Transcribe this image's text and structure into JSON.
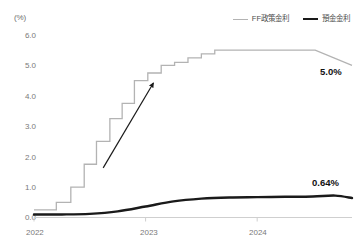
{
  "chart_data": {
    "type": "line",
    "title": "",
    "subtitle": "",
    "xlabel": "",
    "ylabel": "",
    "unit_label": "(%)",
    "ylim": [
      0.0,
      6.0
    ],
    "yticks": [
      "6.0",
      "5.0",
      "4.0",
      "3.0",
      "2.0",
      "1.0",
      "0.0"
    ],
    "ytick_values": [
      6.0,
      5.0,
      4.0,
      3.0,
      2.0,
      1.0,
      0.0
    ],
    "xticks": [
      "2022",
      "2023",
      "2024"
    ],
    "xtick_values": [
      2022.0,
      2023.0,
      2024.0
    ],
    "xlim": [
      2022.0,
      2024.85
    ],
    "grid": false,
    "legend_position": "top-right",
    "series": [
      {
        "name": "FF政策金利",
        "color": "#b3b3b3",
        "style": "step",
        "width": 1.3,
        "end_label": "5.0%",
        "x": [
          2022.0,
          2022.2,
          2022.2,
          2022.33,
          2022.33,
          2022.45,
          2022.45,
          2022.56,
          2022.56,
          2022.68,
          2022.68,
          2022.79,
          2022.79,
          2022.9,
          2022.9,
          2023.02,
          2023.02,
          2023.14,
          2023.14,
          2023.26,
          2023.26,
          2023.38,
          2023.38,
          2023.5,
          2023.5,
          2023.62,
          2023.62,
          2024.52,
          2024.85
        ],
        "values": [
          0.25,
          0.25,
          0.5,
          0.5,
          1.0,
          1.0,
          1.75,
          1.75,
          2.5,
          2.5,
          3.25,
          3.25,
          3.75,
          3.75,
          4.5,
          4.5,
          4.75,
          4.75,
          5.0,
          5.0,
          5.1,
          5.1,
          5.25,
          5.25,
          5.38,
          5.38,
          5.5,
          5.5,
          5.0
        ]
      },
      {
        "name": "預金金利",
        "color": "#1a1a1a",
        "style": "smooth",
        "width": 2.4,
        "end_label": "0.64%",
        "x": [
          2022.0,
          2022.25,
          2022.5,
          2022.75,
          2023.0,
          2023.25,
          2023.5,
          2023.75,
          2024.0,
          2024.25,
          2024.5,
          2024.7,
          2024.85
        ],
        "values": [
          0.1,
          0.1,
          0.12,
          0.2,
          0.36,
          0.53,
          0.62,
          0.66,
          0.67,
          0.68,
          0.69,
          0.72,
          0.64
        ]
      }
    ],
    "annotations": [
      {
        "type": "arrow",
        "name": "upward-trend-arrow",
        "color": "#1a1a1a",
        "x_start": 2022.62,
        "y_start": 1.63,
        "x_end": 2023.07,
        "y_end": 4.42
      }
    ]
  },
  "legend": {
    "items": [
      {
        "label": "FF政策金利",
        "swatch": "ff"
      },
      {
        "label": "預金金利",
        "swatch": "dep"
      }
    ]
  },
  "labels": {
    "ff_end": "5.0%",
    "deposit_end": "0.64%"
  }
}
